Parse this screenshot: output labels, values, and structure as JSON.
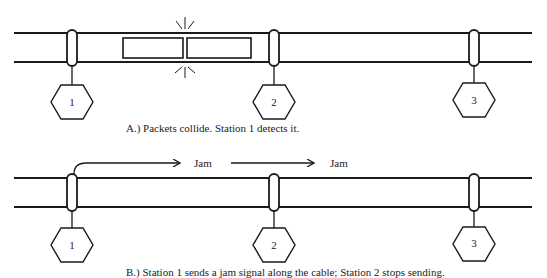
{
  "panel_a": {
    "caption": "A.)  Packets collide.  Station 1 detects it.",
    "stations": [
      {
        "id": "1",
        "x": 72
      },
      {
        "id": "2",
        "x": 274
      },
      {
        "id": "3",
        "x": 474
      }
    ],
    "packets": [
      "packet-left",
      "packet-right"
    ],
    "event": "collision"
  },
  "panel_b": {
    "caption": "B.)  Station 1 sends a jam signal along the cable; Station 2 stops sending.",
    "stations": [
      {
        "id": "1",
        "x": 72
      },
      {
        "id": "2",
        "x": 274
      },
      {
        "id": "3",
        "x": 474
      }
    ],
    "signals": [
      {
        "label": "Jam"
      },
      {
        "label": "Jam"
      }
    ]
  },
  "colors": {
    "line": "#1a1a1a",
    "background": "#ffffff"
  }
}
